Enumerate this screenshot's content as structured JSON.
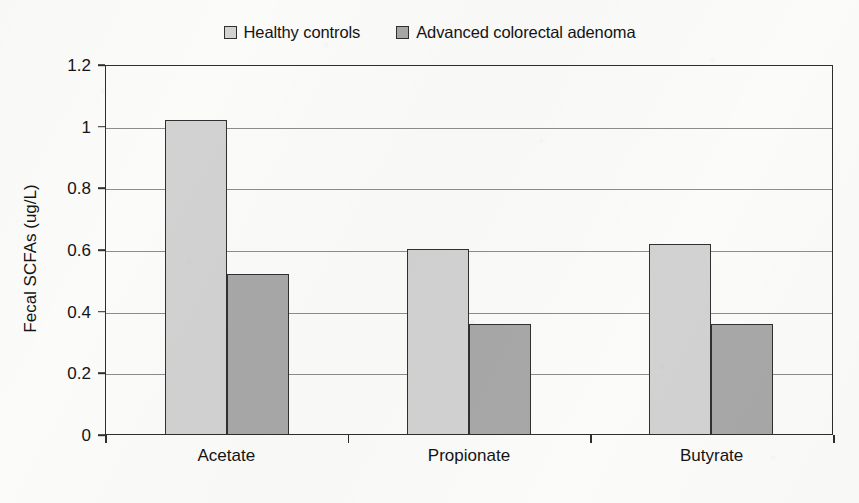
{
  "chart_data": {
    "type": "bar",
    "title": "",
    "subtitle": "",
    "xlabel": "",
    "ylabel": "Fecal SCFAs (ug/L)",
    "categories": [
      "Acetate",
      "Propionate",
      "Butyrate"
    ],
    "series": [
      {
        "name": "Healthy controls",
        "swatch_color": "#d2d2d2",
        "border_color": "#303030",
        "values": [
          1.02,
          0.6,
          0.617
        ]
      },
      {
        "name": "Advanced colorectal adenoma",
        "swatch_color": "#a8a8a8",
        "border_color": "#303030",
        "values": [
          0.52,
          0.356,
          0.356
        ]
      }
    ],
    "ylim": [
      0,
      1.2
    ],
    "ytick_values": [
      0,
      0.2,
      0.4,
      0.6,
      0.8,
      1,
      1.2
    ],
    "ytick_labels": [
      "0",
      "0.2",
      "0.4",
      "0.6",
      "0.8",
      "1",
      "1.2"
    ],
    "grid": true,
    "grid_axis": "y",
    "grid_color": "#8d8d8d",
    "legend_position": "top-center",
    "legend_orientation": "horizontal",
    "axis_color": "#2e2e2e",
    "background_color": "#fbfbfa",
    "text_color": "#141414"
  }
}
